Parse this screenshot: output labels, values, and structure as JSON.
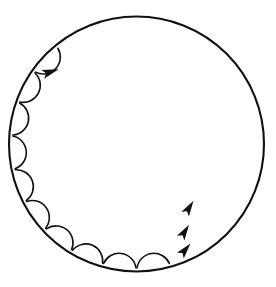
{
  "figure": {
    "type": "geometric-diagram",
    "background_color": "#ffffff",
    "stroke_color": "#111111"
  },
  "chart_data": {
    "type": "scatter",
    "subtitle": "Chord path with caustic envelope",
    "xlabel": "",
    "ylabel": "",
    "grid": false,
    "legend": "none",
    "xlim": [
      8,
      265
    ],
    "ylim": [
      10,
      278
    ],
    "geometry": {
      "outer_circle": {
        "cx": 136.5,
        "cy": 144.0,
        "r": 127.5,
        "stroke_width": 2.1
      },
      "caustic_circle": {
        "cx": 136.5,
        "cy": 144.0,
        "r": 27.0,
        "drawn": false
      },
      "vertex_count": 23,
      "chord_step": 10,
      "start_angle_deg": -90.0,
      "chord_count": 23,
      "chord_stroke_width": 1.5
    },
    "vertices_deg": [
      -90.0,
      -74.35,
      -58.7,
      -43.04,
      -27.39,
      -11.74,
      3.91,
      19.57,
      35.22,
      50.87,
      66.52,
      82.17,
      97.83,
      113.48,
      129.13,
      144.78,
      160.43,
      176.09,
      191.74,
      207.39,
      223.04,
      238.7,
      254.35
    ],
    "angle_arcs": [
      {
        "vertex_index": 11,
        "radius": 17,
        "label": "reflection-angle"
      },
      {
        "vertex_index": 12,
        "radius": 17,
        "label": "reflection-angle"
      },
      {
        "vertex_index": 13,
        "radius": 17,
        "label": "reflection-angle"
      },
      {
        "vertex_index": 14,
        "radius": 17,
        "label": "reflection-angle"
      },
      {
        "vertex_index": 15,
        "radius": 17,
        "label": "reflection-angle"
      },
      {
        "vertex_index": 16,
        "radius": 17,
        "label": "reflection-angle"
      },
      {
        "vertex_index": 17,
        "radius": 17,
        "label": "reflection-angle"
      },
      {
        "vertex_index": 18,
        "radius": 17,
        "label": "reflection-angle"
      },
      {
        "vertex_index": 19,
        "radius": 17,
        "label": "reflection-angle"
      },
      {
        "vertex_index": 20,
        "radius": 17,
        "label": "reflection-angle"
      }
    ],
    "direction_arrows": [
      {
        "x": 50.0,
        "y": 72.0,
        "angle_deg": -18.0,
        "size": 9.0,
        "label": "upper-left-direction-arrow"
      },
      {
        "x": 189.0,
        "y": 208.0,
        "angle_deg": -58.0,
        "size": 8.5,
        "label": "lower-right-direction-arrow-1"
      },
      {
        "x": 184.5,
        "y": 232.0,
        "angle_deg": -58.0,
        "size": 8.5,
        "label": "lower-right-direction-arrow-2"
      },
      {
        "x": 185.0,
        "y": 250.0,
        "angle_deg": -50.0,
        "size": 8.5,
        "label": "lower-right-direction-arrow-3"
      }
    ]
  }
}
